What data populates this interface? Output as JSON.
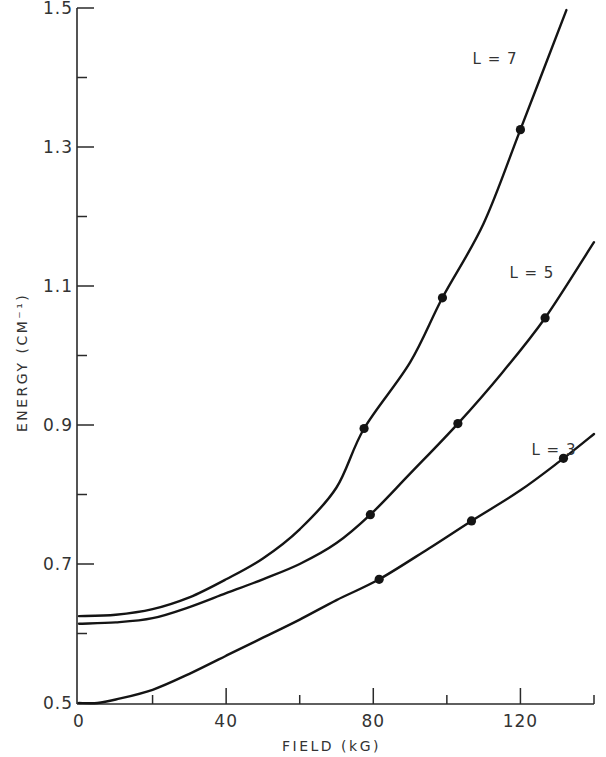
{
  "chart_data": {
    "type": "line",
    "title": "",
    "xlabel": "FIELD (kG)",
    "ylabel": "ENERGY (CM⁻¹)",
    "xlim": [
      0,
      140
    ],
    "ylim": [
      0.5,
      1.5
    ],
    "x_ticks": [
      0,
      40,
      80,
      120
    ],
    "x_tick_labels": [
      "0",
      "40",
      "80",
      "120"
    ],
    "x_minor_ticks": [
      20,
      60,
      100,
      140
    ],
    "y_ticks": [
      0.5,
      0.7,
      0.9,
      1.1,
      1.3,
      1.5
    ],
    "y_tick_labels": [
      "0.5",
      "0.7",
      "0.9",
      "1.1",
      "1.3",
      "1.5"
    ],
    "y_minor_ticks": [
      0.6,
      0.8,
      1.0,
      1.2,
      1.4
    ],
    "grid": false,
    "legend": "inline labels beside each curve",
    "series": [
      {
        "name": "L = 7",
        "label_position": {
          "x": 107,
          "y": 1.42
        },
        "curve": {
          "x": [
            0,
            10,
            20,
            30,
            40,
            50,
            60,
            70,
            77.5,
            90,
            98.8,
            110,
            120,
            132.5
          ],
          "y": [
            0.625,
            0.627,
            0.635,
            0.652,
            0.678,
            0.708,
            0.75,
            0.81,
            0.895,
            0.99,
            1.083,
            1.19,
            1.325,
            1.497
          ]
        },
        "points": {
          "x": [
            77.5,
            98.8,
            120
          ],
          "y": [
            0.895,
            1.083,
            1.325
          ]
        }
      },
      {
        "name": "L = 5",
        "label_position": {
          "x": 117,
          "y": 1.112
        },
        "curve": {
          "x": [
            0,
            10,
            20,
            30,
            40,
            50,
            60,
            70,
            79.2,
            90,
            103,
            115,
            126.7,
            140
          ],
          "y": [
            0.614,
            0.616,
            0.622,
            0.638,
            0.658,
            0.678,
            0.7,
            0.73,
            0.771,
            0.83,
            0.902,
            0.975,
            1.054,
            1.163
          ]
        },
        "points": {
          "x": [
            79.2,
            103,
            126.7
          ],
          "y": [
            0.771,
            0.902,
            1.054
          ]
        }
      },
      {
        "name": "L = 3",
        "label_position": {
          "x": 123,
          "y": 0.857
        },
        "curve": {
          "x": [
            0,
            5,
            10,
            20,
            30,
            40,
            50,
            60,
            70,
            81.6,
            95,
            106.7,
            120,
            131.7,
            140
          ],
          "y": [
            0.5,
            0.5,
            0.505,
            0.519,
            0.542,
            0.568,
            0.594,
            0.62,
            0.648,
            0.678,
            0.722,
            0.762,
            0.806,
            0.852,
            0.887
          ]
        },
        "points": {
          "x": [
            81.6,
            106.7,
            131.7
          ],
          "y": [
            0.678,
            0.762,
            0.852
          ]
        }
      }
    ]
  },
  "axes": {
    "x_title": "FIELD (kG)",
    "y_title": "ENERGY (CM⁻¹)"
  },
  "colors": {
    "ink": "#141414",
    "axis": "#2a2a2a",
    "text": "#333333",
    "background": "#ffffff"
  }
}
